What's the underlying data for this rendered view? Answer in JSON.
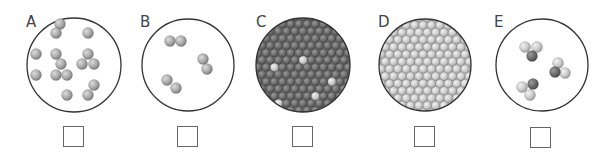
{
  "figure": {
    "colors": {
      "outline": "#333333",
      "light_atom": "#c8c8c8",
      "mid_atom": "#a9a9a9",
      "dark_atom": "#6e6e6e",
      "box_border": "#666666"
    },
    "panels": [
      {
        "label": "A",
        "content": "single gray atoms, monatomic gas",
        "answer": ""
      },
      {
        "label": "B",
        "content": "three diatomic molecules, same element",
        "answer": ""
      },
      {
        "label": "C",
        "content": "packed solid of dark atoms with scattered light atoms (mixture/alloy)",
        "answer": ""
      },
      {
        "label": "D",
        "content": "packed solid of identical light atoms (element, solid)",
        "answer": ""
      },
      {
        "label": "E",
        "content": "three triatomic molecules, one dark + two light atoms (compound gas)",
        "answer": ""
      }
    ]
  }
}
